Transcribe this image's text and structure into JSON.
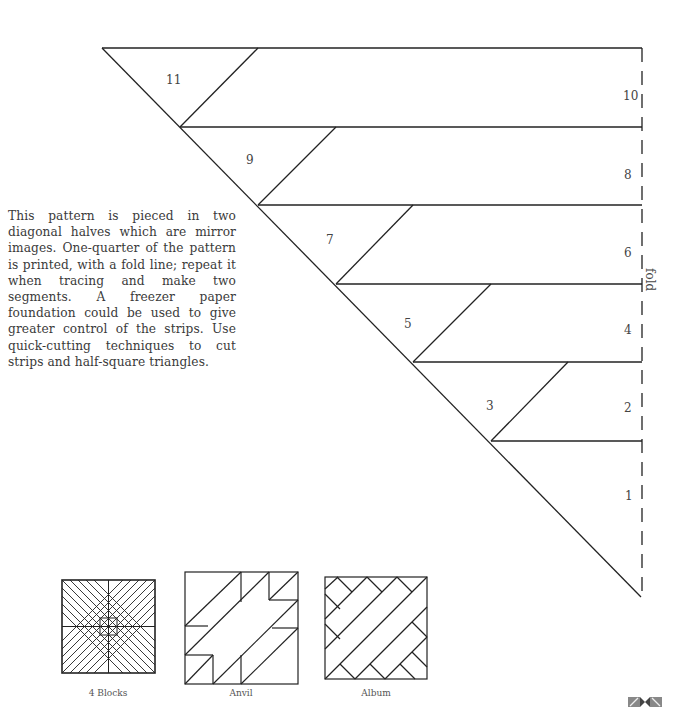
{
  "description": "This pattern is pieced in two diagonal halves which are mirror images. One-quarter of the pattern is printed, with a fold line; repeat it when tracing and make two segments. A freezer paper foundation could be used to give greater control of the strips. Use quick-cutting techniques to cut strips and half-square triangles.",
  "pattern": {
    "fold_label": "fold",
    "pieces": [
      "1",
      "2",
      "3",
      "4",
      "5",
      "6",
      "7",
      "8",
      "9",
      "10",
      "11"
    ]
  },
  "thumbnails": [
    {
      "caption": "4 Blocks"
    },
    {
      "caption": "Anvil"
    },
    {
      "caption": "Album"
    }
  ],
  "colors": {
    "line": "#222222",
    "text": "#3a3a3a"
  }
}
